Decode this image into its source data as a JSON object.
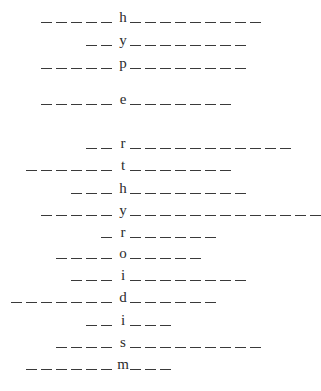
{
  "puzzle": {
    "word": "hyperthyroidism",
    "rows": [
      {
        "letter": "h",
        "left": 5,
        "right": 9,
        "y": 22
      },
      {
        "letter": "y",
        "left": 2,
        "right": 8,
        "y": 45
      },
      {
        "letter": "p",
        "left": 5,
        "right": 8,
        "y": 68
      },
      {
        "letter": "e",
        "left": 5,
        "right": 7,
        "y": 104
      },
      {
        "letter": "r",
        "left": 2,
        "right": 11,
        "y": 148
      },
      {
        "letter": "t",
        "left": 6,
        "right": 7,
        "y": 170
      },
      {
        "letter": "h",
        "left": 3,
        "right": 8,
        "y": 193
      },
      {
        "letter": "y",
        "left": 5,
        "right": 13,
        "y": 215
      },
      {
        "letter": "r",
        "left": 1,
        "right": 6,
        "y": 237
      },
      {
        "letter": "o",
        "left": 4,
        "right": 5,
        "y": 258
      },
      {
        "letter": "i",
        "left": 3,
        "right": 8,
        "y": 280
      },
      {
        "letter": "d",
        "left": 7,
        "right": 6,
        "y": 302
      },
      {
        "letter": "i",
        "left": 2,
        "right": 3,
        "y": 325
      },
      {
        "letter": "s",
        "left": 4,
        "right": 9,
        "y": 347
      },
      {
        "letter": "m",
        "left": 6,
        "right": 3,
        "y": 369
      }
    ],
    "letter_x": 117,
    "blank_pitch": 15,
    "blank_color": "#3a3a3a"
  }
}
